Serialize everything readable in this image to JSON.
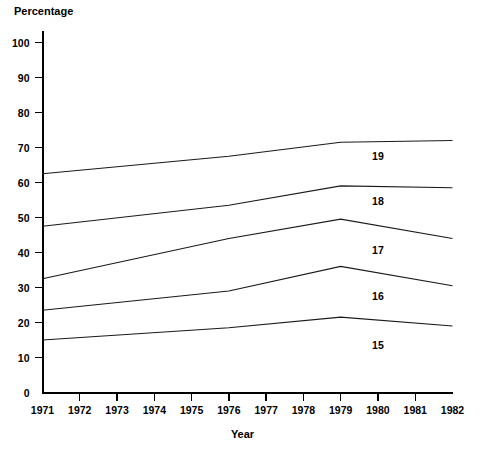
{
  "chart_data": {
    "type": "line",
    "title": "",
    "xlabel": "Year",
    "ylabel": "Percentage",
    "x": [
      1971,
      1976,
      1979,
      1982
    ],
    "xlim": [
      1971,
      1982
    ],
    "ylim": [
      0,
      100
    ],
    "x_tick_labels": [
      "1971",
      "1972",
      "1973",
      "1974",
      "1975",
      "1976",
      "1977",
      "1978",
      "1979",
      "1980",
      "1981",
      "1982"
    ],
    "y_tick_labels": [
      "0",
      "10",
      "20",
      "30",
      "40",
      "50",
      "60",
      "70",
      "80",
      "90",
      "100"
    ],
    "y_ticks": [
      0,
      10,
      20,
      30,
      40,
      50,
      60,
      70,
      80,
      90,
      100
    ],
    "grid": false,
    "legend_position": "inline-right",
    "series": [
      {
        "name": "19",
        "label": "19",
        "values": [
          62.5,
          67.5,
          71.5,
          72.0
        ],
        "label_x": 1980.0,
        "label_y": 66.5
      },
      {
        "name": "18",
        "label": "18",
        "values": [
          47.5,
          53.5,
          59.0,
          58.5
        ],
        "label_x": 1980.0,
        "label_y": 53.5
      },
      {
        "name": "17",
        "label": "17",
        "values": [
          32.5,
          44.0,
          49.5,
          44.0
        ],
        "label_x": 1980.0,
        "label_y": 39.5
      },
      {
        "name": "16",
        "label": "16",
        "values": [
          23.5,
          29.0,
          36.0,
          30.5
        ],
        "label_x": 1980.0,
        "label_y": 26.5
      },
      {
        "name": "15",
        "label": "15",
        "values": [
          15.0,
          18.5,
          21.5,
          19.0
        ],
        "label_x": 1980.0,
        "label_y": 12.5
      }
    ]
  },
  "axes": {
    "y_title": "Percentage",
    "x_title": "Year"
  }
}
